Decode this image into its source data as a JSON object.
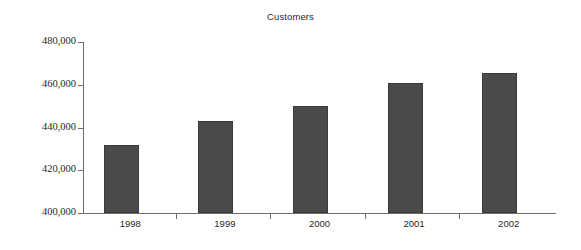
{
  "chart_data": {
    "type": "bar",
    "title": "Customers",
    "xlabel": "",
    "ylabel": "",
    "categories": [
      "1998",
      "1999",
      "2000",
      "2001",
      "2002"
    ],
    "values": [
      432000,
      443000,
      450000,
      461000,
      465500
    ],
    "ylim": [
      400000,
      480000
    ],
    "ytick_values": [
      480000,
      460000,
      440000,
      420000,
      400000
    ],
    "ytick_labels": [
      "480,000",
      "460,000",
      "440,000",
      "420,000",
      "400,000"
    ],
    "grid": false,
    "legend": "none",
    "bar_color": "#4a4a4a",
    "axis_color": "#6d6d6d",
    "background_color": "#ffffff"
  }
}
